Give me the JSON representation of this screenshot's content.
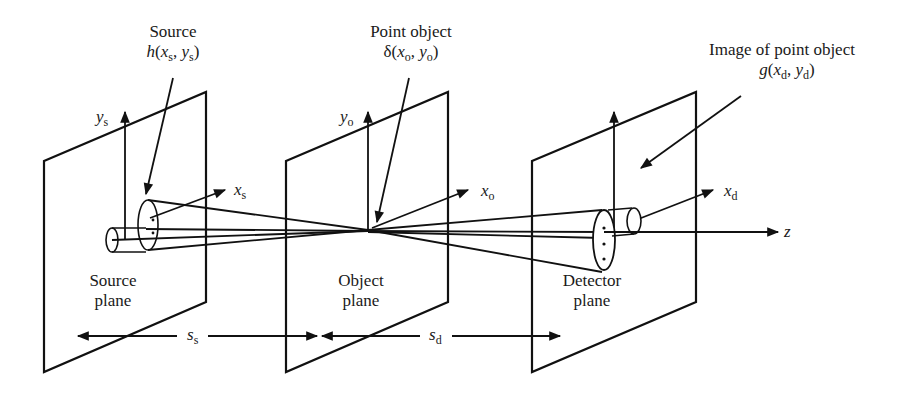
{
  "diagram": {
    "planes": [
      {
        "id": "source",
        "label_line1": "Source",
        "label_line2": "plane",
        "axis_x": "x",
        "axis_x_sub": "s",
        "axis_y": "y",
        "axis_y_sub": "s"
      },
      {
        "id": "object",
        "label_line1": "Object",
        "label_line2": "plane",
        "axis_x": "x",
        "axis_x_sub": "o",
        "axis_y": "y",
        "axis_y_sub": "o"
      },
      {
        "id": "detector",
        "label_line1": "Detector",
        "label_line2": "plane",
        "axis_x": "x",
        "axis_x_sub": "d"
      }
    ],
    "callouts": {
      "source": {
        "title": "Source",
        "func": "h",
        "arg1": "x",
        "arg1_sub": "s",
        "arg2": "y",
        "arg2_sub": "s"
      },
      "point_object": {
        "title": "Point object",
        "func": "δ",
        "arg1": "x",
        "arg1_sub": "o",
        "arg2": "y",
        "arg2_sub": "o"
      },
      "image": {
        "title": "Image of point object",
        "func": "g",
        "arg1": "x",
        "arg1_sub": "d",
        "arg2": "y",
        "arg2_sub": "d"
      }
    },
    "optical_axis": {
      "label": "z"
    },
    "distances": [
      {
        "symbol": "s",
        "sub": "s"
      },
      {
        "symbol": "s",
        "sub": "d"
      }
    ],
    "colors": {
      "ink": "#111111",
      "background": "#ffffff"
    }
  }
}
